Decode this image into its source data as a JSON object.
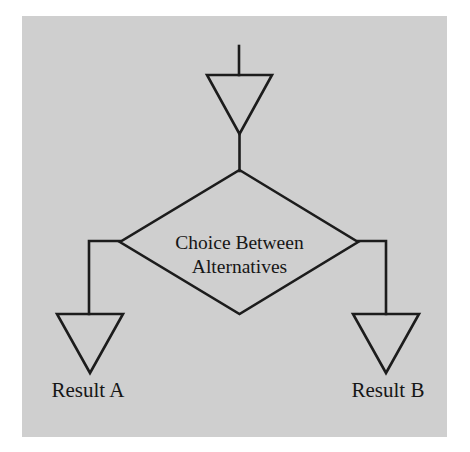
{
  "diagram": {
    "background_color": "#cfcfcf",
    "shape_fill_color": "#fbfbfb",
    "line_color": "#1c1c1c",
    "text_color": "#161616",
    "decision": {
      "label_line1": "Choice Between",
      "label_line2": "Alternatives",
      "shape": "diamond"
    },
    "nodes": {
      "input_triangle": "input-triangle",
      "result_a_triangle": "result-a-triangle",
      "result_b_triangle": "result-b-triangle"
    },
    "labels": {
      "result_a": "Result A",
      "result_b": "Result B"
    },
    "connectors": {
      "top_stem": "top-stem-line",
      "middle_stem": "middle-stem-line",
      "left_branch": "left-branch-line",
      "right_branch": "right-branch-line"
    }
  }
}
